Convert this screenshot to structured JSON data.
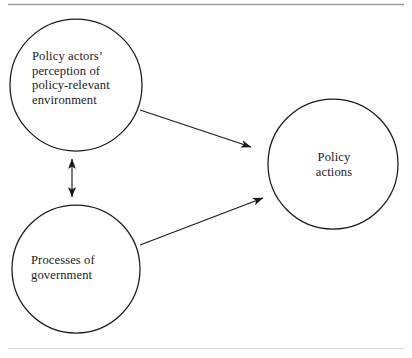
{
  "figure": {
    "type": "conceptual-diagram",
    "background_color": "#ffffff",
    "stroke_color": "#1b1b1b",
    "text_color": "#1b1b1b",
    "rule_color": "#9a9a9a",
    "nodes": [
      {
        "id": "perception",
        "shape": "circle",
        "label": "Policy actors’\nperception of\npolicy-relevant\nenvironment",
        "cx": 76,
        "cy": 85,
        "r": 66
      },
      {
        "id": "processes",
        "shape": "circle",
        "label": "Processes of\ngovernment",
        "cx": 76,
        "cy": 269,
        "r": 64
      },
      {
        "id": "actions",
        "shape": "circle",
        "label": "Policy\nactions",
        "cx": 333,
        "cy": 164,
        "r": 65
      }
    ],
    "edges": [
      {
        "id": "perception-to-actions",
        "from": "perception",
        "to": "actions",
        "arrowheads": "single",
        "x1": 140,
        "y1": 110,
        "x2": 251,
        "y2": 147
      },
      {
        "id": "processes-to-actions",
        "from": "processes",
        "to": "actions",
        "arrowheads": "single",
        "x1": 140,
        "y1": 245,
        "x2": 263,
        "y2": 198
      },
      {
        "id": "perception-processes-bidirectional",
        "from": "perception",
        "to": "processes",
        "arrowheads": "double",
        "x1": 72,
        "y1": 158,
        "x2": 72,
        "y2": 198
      }
    ],
    "rules": [
      {
        "id": "top-rule",
        "x1": 8,
        "y1": 4,
        "x2": 404,
        "y2": 4
      },
      {
        "id": "bottom-rule",
        "x1": 8,
        "y1": 348,
        "x2": 404,
        "y2": 348
      }
    ]
  }
}
